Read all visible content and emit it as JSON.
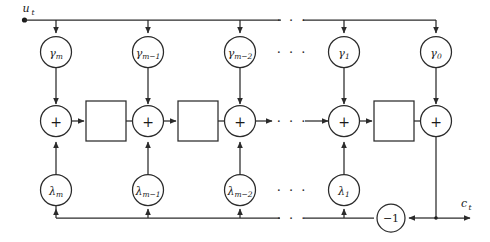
{
  "diagram": {
    "colors": {
      "line": "#2b2b2b",
      "text": "#1a1a1a",
      "background": "#ffffff"
    },
    "io": {
      "input_label": "u",
      "input_sub": "t",
      "output_label": "c",
      "output_sub": "t"
    },
    "gamma_row": {
      "nodes": [
        {
          "base": "γ",
          "sub": "m"
        },
        {
          "base": "γ",
          "sub": "m−1"
        },
        {
          "base": "γ",
          "sub": "m−2"
        },
        {
          "base": "γ",
          "sub": "1"
        },
        {
          "base": "γ",
          "sub": "0"
        }
      ],
      "ellipsis": "· · ·"
    },
    "sum_row": {
      "operator": "+",
      "count": 5,
      "ellipsis": "· · ·",
      "delay_boxes": 4,
      "delay_label": ""
    },
    "lambda_row": {
      "nodes": [
        {
          "base": "λ",
          "sub": "m"
        },
        {
          "base": "λ",
          "sub": "m−1"
        },
        {
          "base": "λ",
          "sub": "m−2"
        },
        {
          "base": "λ",
          "sub": "1"
        }
      ],
      "ellipsis": "· · ·"
    },
    "feedback": {
      "gain_label": "−1",
      "ellipsis": "· · ·"
    }
  }
}
